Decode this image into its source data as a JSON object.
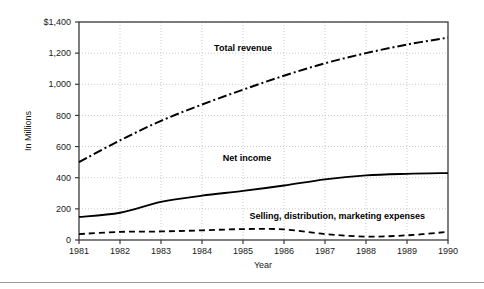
{
  "chart_data": {
    "type": "line",
    "title": "",
    "xlabel": "Year",
    "ylabel": "In Millions",
    "x": [
      1981,
      1982,
      1983,
      1984,
      1985,
      1986,
      1987,
      1988,
      1989,
      1990
    ],
    "categories": [
      "1981",
      "1982",
      "1983",
      "1984",
      "1985",
      "1986",
      "1987",
      "1988",
      "1989",
      "1990"
    ],
    "xlim": [
      1981,
      1990
    ],
    "ylim": [
      0,
      1400
    ],
    "yticks": [
      0,
      200,
      400,
      600,
      800,
      1000,
      1200,
      1400
    ],
    "ytick_labels": [
      "0",
      "200",
      "400",
      "600",
      "800",
      "1,000",
      "1,200",
      "$1,400"
    ],
    "grid": true,
    "grid_style": "dotted",
    "legend_position": "inline-annotations",
    "series": [
      {
        "name": "Total revenue",
        "style": "dash-dot",
        "color": "#000000",
        "values": [
          500,
          640,
          765,
          870,
          965,
          1055,
          1135,
          1200,
          1255,
          1300
        ],
        "label_x": 1985.0,
        "label_y": 1215
      },
      {
        "name": "Net income",
        "style": "solid",
        "color": "#000000",
        "values": [
          148,
          175,
          245,
          285,
          315,
          350,
          390,
          415,
          425,
          430
        ],
        "label_x": 1985.1,
        "label_y": 505
      },
      {
        "name": "Selling, distribution, marketing expenses",
        "style": "dashed",
        "color": "#000000",
        "values": [
          38,
          52,
          55,
          62,
          70,
          68,
          38,
          22,
          30,
          52
        ],
        "label_x": 1987.3,
        "label_y": 132
      }
    ]
  },
  "axes": {
    "x_title": "Year",
    "y_title": "In Millions"
  }
}
